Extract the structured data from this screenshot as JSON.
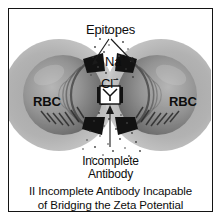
{
  "figure": {
    "panel_number": "II",
    "border_color": "#141414",
    "background_color": "#ffffff"
  },
  "labels": {
    "epitopes": "Epitopes",
    "sodium_ion": "Na",
    "sodium_charge": "+",
    "chloride_ion": "Cl",
    "chloride_charge": "−",
    "rbc_left": "RBC",
    "rbc_right": "RBC",
    "antibody_line1": "Incomplete",
    "antibody_line2": "Antibody"
  },
  "caption": {
    "line1": "II Incomplete Antibody Incapable",
    "line2": "of Bridging the Zeta Potential"
  },
  "diagram": {
    "cell_body_color": "#8f8f8f",
    "halo_color": "#b8b8b8",
    "epitope_color": "#121212",
    "antibody_box_fill": "#ffffff",
    "antibody_box_stroke": "#111111",
    "ion_dot_color": "#4a4a4a",
    "leader_line_color": "#1a1a1a",
    "left_cell_center_x": 62,
    "right_cell_center_x": 143,
    "cell_center_y": 94,
    "cell_radius": 44,
    "halo_radius": 58,
    "epitope_count_per_cell": 3
  }
}
